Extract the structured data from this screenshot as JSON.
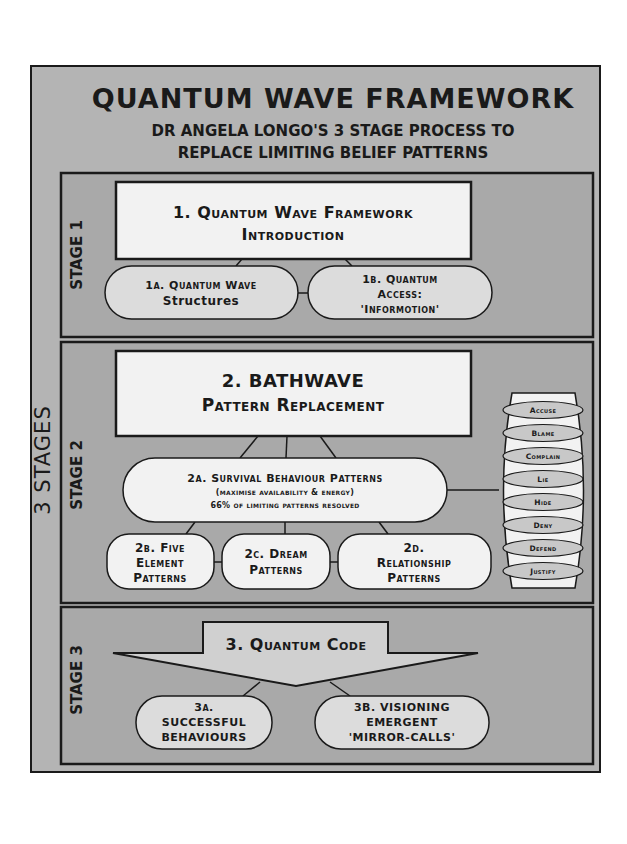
{
  "title": "QUANTUM WAVE FRAMEWORK",
  "subtitle_line1": "DR ANGELA LONGO'S 3 STAGE PROCESS TO",
  "subtitle_line2": "REPLACE LIMITING BELIEF PATTERNS",
  "side_label": "3 STAGES",
  "colors": {
    "outer_bg": "#b4b4b4",
    "stage_bg": "#a9a9a9",
    "box_fill": "#f2f2f2",
    "pill_fill": "#dcdcdc",
    "small_pill_fill": "#c8c8c8",
    "stroke": "#1a1a1a"
  },
  "stages": [
    {
      "label": "STAGE 1",
      "main": {
        "line1": "1. Quantum Wave Framework",
        "line2": "Introduction"
      },
      "children": [
        {
          "lines": [
            "1a. Quantum Wave",
            "Structures"
          ]
        },
        {
          "lines": [
            "1b. Quantum",
            "Access:",
            "'Informotion'"
          ]
        }
      ]
    },
    {
      "label": "STAGE 2",
      "main": {
        "line1": "2. BATHWAVE",
        "line2": "Pattern Replacement"
      },
      "survival": {
        "line1": "2a. Survival Behaviour Patterns",
        "line2": "(maximise availability & energy)",
        "line3": "66% of limiting patterns resolved"
      },
      "children": [
        {
          "lines": [
            "2b. Five",
            "Element",
            "Patterns"
          ]
        },
        {
          "lines": [
            "2c. Dream",
            "Patterns"
          ]
        },
        {
          "lines": [
            "2d.",
            "Relationship",
            "Patterns"
          ]
        }
      ],
      "behaviours": [
        "Accuse",
        "Blame",
        "Complain",
        "Lie",
        "Hide",
        "Deny",
        "Defend",
        "Justify"
      ]
    },
    {
      "label": "STAGE 3",
      "main": {
        "line1": "3. Quantum Code"
      },
      "children": [
        {
          "lines": [
            "3a.",
            "Successful",
            "Behaviours"
          ]
        },
        {
          "lines": [
            "3b. Visioning",
            "Emergent",
            "'Mirror-Calls'"
          ]
        }
      ]
    }
  ]
}
